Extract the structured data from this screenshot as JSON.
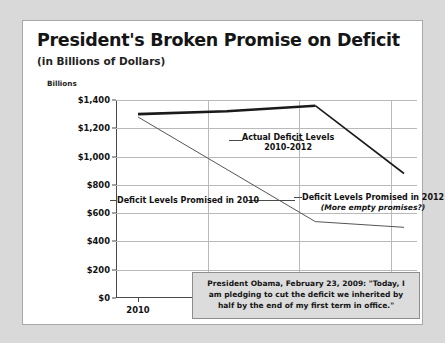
{
  "card": {
    "title": "President's Broken Promise on Deficit",
    "subtitle": "(in Billions of Dollars)",
    "units_label": "Billions"
  },
  "quote": {
    "text": "President Obama, February 23, 2009: \"Today, I am pledging to cut the deficit we inherited by half by the end of my first term in office.\""
  },
  "annotations": {
    "actual_line1": "Actual Deficit Levels",
    "actual_line2": "2010-2012",
    "promised_2010": "Deficit Levels Promised in 2010",
    "promised_2012_line1": "Deficit Levels Promised in 2012",
    "promised_2012_line2": "(More empty promises?)"
  },
  "chart_data": {
    "type": "line",
    "title": "President's Broken Promise on Deficit",
    "subtitle": "(in Billions of Dollars)",
    "xlabel": "",
    "ylabel": "Billions",
    "ylim": [
      0,
      1400
    ],
    "xlim": [
      2010,
      2013
    ],
    "ytick_labels": [
      "$0",
      "$200",
      "$400",
      "$600",
      "$800",
      "$1,000",
      "$1,200",
      "$1,400"
    ],
    "ytick_values": [
      0,
      200,
      400,
      600,
      800,
      1000,
      1200,
      1400
    ],
    "categories": [
      "2010",
      "2011",
      "2012",
      "2013"
    ],
    "grid": true,
    "legend": "annotations-inline",
    "series": [
      {
        "name": "Actual Deficit Levels 2010-2012",
        "style": "thick",
        "color": "#1a1a1a",
        "x": [
          2010,
          2011,
          2012
        ],
        "values": [
          1300,
          1320,
          1360
        ]
      },
      {
        "name": "Deficit Levels Promised in 2012",
        "style": "medium",
        "color": "#1a1a1a",
        "x": [
          2012,
          2013
        ],
        "values": [
          1360,
          880
        ]
      },
      {
        "name": "Deficit Levels Promised in 2010",
        "style": "thin",
        "color": "#555555",
        "x": [
          2010,
          2012,
          2013
        ],
        "values": [
          1280,
          540,
          500
        ]
      }
    ]
  }
}
